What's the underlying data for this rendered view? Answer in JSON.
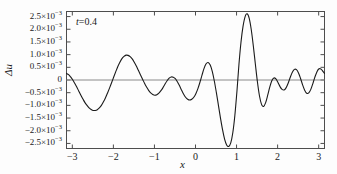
{
  "chart_data": {
    "type": "line",
    "title": "",
    "subtitle": "",
    "xlabel": "x",
    "ylabel": "Δu",
    "annotation": "t=0.4",
    "annotation_symbol": "t",
    "annotation_value": "=0.4",
    "xlim": [
      -3.14159,
      3.14159
    ],
    "ylim": [
      -0.0027,
      0.0027
    ],
    "grid": false,
    "legend": "none",
    "line_color": "#1a1a1a",
    "axis_color": "#4d4d4d",
    "zero_line_color": "#808080",
    "background": "#fdfdfd",
    "xticks": [
      -3,
      -2,
      -1,
      0,
      1,
      2,
      3
    ],
    "xticklabels": [
      "−3",
      "−2",
      "−1",
      "0",
      "1",
      "2",
      "3"
    ],
    "yticks": [
      0.0025,
      0.002,
      0.0015,
      0.001,
      0.0005,
      0,
      -0.0005,
      -0.001,
      -0.0015,
      -0.002,
      -0.0025
    ],
    "yticklabels": [
      "2.5×10<sup>−3</sup>",
      "2.0×10<sup>−3</sup>",
      "1.5×10<sup>−3</sup>",
      "1.0×10<sup>−3</sup>",
      "0.5×10<sup>−3</sup>",
      "0",
      "−0.5×10<sup>−3</sup>",
      "−1.0×10<sup>−3</sup>",
      "−1.5×10<sup>−3</sup>",
      "−2.0×10<sup>−3</sup>",
      "−2.5×10<sup>−3</sup>"
    ],
    "series": [
      {
        "name": "Δu",
        "x": [
          -3.1416,
          -3.0916,
          -3.0416,
          -2.9916,
          -2.9416,
          -2.8916,
          -2.8416,
          -2.7916,
          -2.7416,
          -2.6916,
          -2.6416,
          -2.5916,
          -2.5416,
          -2.4916,
          -2.4416,
          -2.3916,
          -2.3416,
          -2.2916,
          -2.2416,
          -2.1916,
          -2.1416,
          -2.0916,
          -2.0416,
          -1.9916,
          -1.9416,
          -1.8916,
          -1.8416,
          -1.7916,
          -1.7416,
          -1.6916,
          -1.6416,
          -1.5916,
          -1.5416,
          -1.4916,
          -1.4416,
          -1.3916,
          -1.3416,
          -1.2916,
          -1.2416,
          -1.1916,
          -1.1416,
          -1.0916,
          -1.0416,
          -0.9916,
          -0.9416,
          -0.8916,
          -0.8416,
          -0.7916,
          -0.7416,
          -0.6916,
          -0.6416,
          -0.5916,
          -0.5416,
          -0.4916,
          -0.4416,
          -0.3916,
          -0.3416,
          -0.2916,
          -0.2416,
          -0.1916,
          -0.1416,
          -0.0916,
          -0.0416,
          0.0084,
          0.0584,
          0.1084,
          0.1584,
          0.2084,
          0.2584,
          0.3084,
          0.3584,
          0.4084,
          0.4584,
          0.5084,
          0.5584,
          0.6084,
          0.6584,
          0.7084,
          0.7584,
          0.8084,
          0.8584,
          0.9084,
          0.9584,
          1.0084,
          1.0584,
          1.1084,
          1.1584,
          1.2084,
          1.2584,
          1.3084,
          1.3584,
          1.4084,
          1.4584,
          1.5084,
          1.5584,
          1.6084,
          1.6584,
          1.7084,
          1.7584,
          1.8084,
          1.8584,
          1.9084,
          1.9584,
          2.0084,
          2.0584,
          2.1084,
          2.1584,
          2.2084,
          2.2584,
          2.3084,
          2.3584,
          2.4084,
          2.4584,
          2.5084,
          2.5584,
          2.6084,
          2.6584,
          2.7084,
          2.7584,
          2.8084,
          2.8584,
          2.9084,
          2.9584,
          3.0084,
          3.0584,
          3.1084,
          3.1416
        ],
        "y": [
          0.00026,
          0.00021,
          0.00012,
          1e-05,
          -0.00013,
          -0.00028,
          -0.00044,
          -0.0006,
          -0.00075,
          -0.00089,
          -0.001,
          -0.0011,
          -0.00116,
          -0.0012,
          -0.0012,
          -0.00117,
          -0.0011,
          -0.001,
          -0.00086,
          -0.0007,
          -0.00051,
          -0.00031,
          -0.0001,
          0.00012,
          0.00033,
          0.00053,
          0.0007,
          0.00084,
          0.00093,
          0.00098,
          0.00097,
          0.00092,
          0.00083,
          0.0007,
          0.00055,
          0.00038,
          0.00021,
          4e-05,
          -0.00013,
          -0.00028,
          -0.00041,
          -0.00051,
          -0.00057,
          -0.0006,
          -0.00058,
          -0.00052,
          -0.00042,
          -0.0003,
          -0.00016,
          -3e-05,
          7e-05,
          0.00012,
          0.00011,
          5e-05,
          -7e-05,
          -0.00022,
          -0.00039,
          -0.00055,
          -0.00068,
          -0.00076,
          -0.00079,
          -0.00076,
          -0.00068,
          -0.00054,
          -0.00034,
          -9e-05,
          0.00019,
          0.00046,
          0.00064,
          0.00069,
          0.00059,
          0.00034,
          -4e-05,
          -0.0005,
          -0.001,
          -0.0015,
          -0.00196,
          -0.00233,
          -0.00256,
          -0.00262,
          -0.00248,
          -0.00208,
          -0.0014,
          -0.00046,
          0.00062,
          0.0015,
          0.00212,
          0.0025,
          0.00261,
          0.00243,
          0.00198,
          0.00134,
          0.00062,
          -8e-05,
          -0.00063,
          -0.00096,
          -0.00104,
          -0.00089,
          -0.0006,
          -0.00028,
          -3e-05,
          8e-05,
          4e-05,
          -0.0001,
          -0.00026,
          -0.00037,
          -0.00039,
          -0.0003,
          -0.00012,
          0.00011,
          0.00031,
          0.00042,
          0.00041,
          0.00028,
          6e-05,
          -0.00019,
          -0.0004,
          -0.00052,
          -0.00051,
          -0.00037,
          -0.00014,
          0.00012,
          0.00033,
          0.00044,
          0.00043,
          0.00033,
          0.00026
        ],
        "notable_points": {
          "global_max": {
            "x": 0.6,
            "y": 0.00261
          },
          "global_min": {
            "x": 0.32,
            "y": -0.00262
          },
          "left_min": {
            "x": -2.45,
            "y": -0.0012
          },
          "left_max": {
            "x": -1.69,
            "y": 0.00098
          },
          "secondary_max": {
            "x": -0.36,
            "y": 0.00069
          }
        }
      }
    ]
  }
}
